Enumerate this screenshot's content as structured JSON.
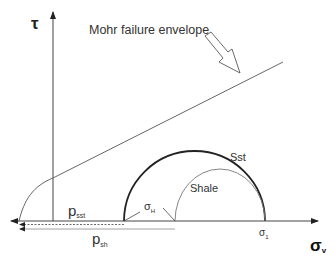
{
  "diagram": {
    "y_axis_label": "τ",
    "x_axis_label": "σ",
    "x_axis_label_sub": "v",
    "envelope_label": "Mohr failure envelope",
    "circle_sst_label": "Sst",
    "circle_shale_label": "Shale",
    "sigma_h_label": "σ",
    "sigma_h_sub": "H",
    "sigma_1_label": "σ",
    "sigma_1_sub": "1",
    "p_sst_label": "p",
    "p_sst_sub": "sst",
    "p_sh_label": "p",
    "p_sh_sub": "sh"
  },
  "colors": {
    "line": "#333333",
    "thin": "#555555",
    "background": "#ffffff"
  }
}
